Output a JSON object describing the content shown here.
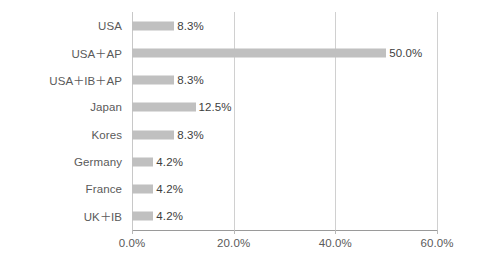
{
  "chart_data": {
    "type": "bar",
    "orientation": "horizontal",
    "title": "",
    "subtitle": "",
    "xlabel": "",
    "ylabel": "",
    "categories": [
      "USA",
      "USA＋AP",
      "USA＋IB＋AP",
      "Japan",
      "Kores",
      "Germany",
      "France",
      "UK＋IB"
    ],
    "values": [
      8.3,
      50.0,
      8.3,
      12.5,
      8.3,
      4.2,
      4.2,
      4.2
    ],
    "data_labels": [
      "8.3%",
      "50.0%",
      "8.3%",
      "12.5%",
      "8.3%",
      "4.2%",
      "4.2%",
      "4.2%"
    ],
    "xlim": [
      0.0,
      60.0
    ],
    "xticks": [
      0.0,
      20.0,
      40.0,
      60.0
    ],
    "xtick_labels": [
      "0.0%",
      "20.0%",
      "40.0%",
      "60.0%"
    ],
    "grid": true,
    "grid_axis": "x",
    "legend": false,
    "legend_position": "none",
    "bar_color": "#c0c0c0",
    "gridline_color": "#d0d0d0",
    "axis_color": "#9a9a9a",
    "label_color": "#5a5a5a",
    "value_label_color": "#3d3d3d",
    "background_color": "#ffffff"
  }
}
